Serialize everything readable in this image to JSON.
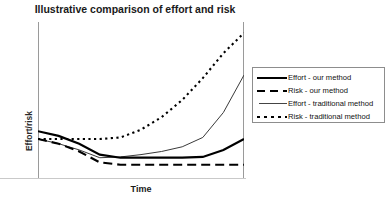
{
  "chart_data": {
    "type": "line",
    "title": "Illustrative comparison of effort and risk",
    "xlabel": "Time",
    "ylabel": "Effort/risk",
    "grid": false,
    "legend_position": "right",
    "xlim": [
      0,
      10
    ],
    "ylim": [
      0,
      10
    ],
    "x": [
      0,
      1,
      2,
      3,
      4,
      5,
      6,
      7,
      8,
      9,
      10
    ],
    "series": [
      {
        "name": "Effort - our method",
        "style": "solid-thick",
        "values": [
          3.0,
          2.7,
          2.2,
          1.5,
          1.3,
          1.3,
          1.3,
          1.3,
          1.35,
          1.8,
          2.5
        ]
      },
      {
        "name": "Risk - our method",
        "style": "dashed-thick",
        "values": [
          2.5,
          2.2,
          1.7,
          1.0,
          0.85,
          0.85,
          0.85,
          0.85,
          0.85,
          0.85,
          0.85
        ]
      },
      {
        "name": "Effort - traditional method",
        "style": "solid-thin",
        "values": [
          2.5,
          2.2,
          1.8,
          1.3,
          1.35,
          1.5,
          1.7,
          2.0,
          2.6,
          4.2,
          6.6
        ]
      },
      {
        "name": "Risk - traditional method",
        "style": "dotted-thick",
        "values": [
          2.5,
          2.5,
          2.5,
          2.5,
          2.6,
          3.1,
          3.9,
          5.0,
          6.4,
          8.0,
          9.3
        ]
      }
    ]
  },
  "chart": {
    "title": "Illustrative comparison of effort and risk",
    "xlabel": "Time",
    "ylabel": "Effort/risk"
  },
  "legend": {
    "items": [
      {
        "label": "Effort - our method",
        "key": "solid-thick"
      },
      {
        "label": "Risk - our method",
        "key": "dashed-thick"
      },
      {
        "label": "Effort - traditional method",
        "key": "solid-thin"
      },
      {
        "label": "Risk - traditional method",
        "key": "dotted-thick"
      }
    ]
  },
  "colors": {
    "line": "#000000",
    "thin_line": "#444444",
    "axis": "#9a9a9a",
    "legend_border": "#8d8d8d",
    "background": "#ffffff"
  }
}
